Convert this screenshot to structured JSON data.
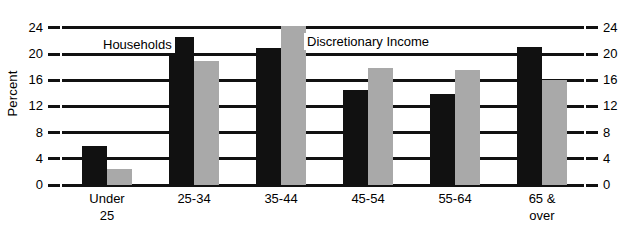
{
  "chart_data": {
    "type": "bar",
    "title": "",
    "xlabel": "",
    "ylabel": "Percent",
    "categories": [
      "Under\n25",
      "25-34",
      "35-44",
      "45-54",
      "55-64",
      "65 &\nover"
    ],
    "series": [
      {
        "name": "Households",
        "color": "#111111",
        "values": [
          5.9,
          22.6,
          20.9,
          14.5,
          13.9,
          21.0
        ]
      },
      {
        "name": "Discretionary Income",
        "color": "#a9a9a9",
        "values": [
          2.4,
          18.9,
          24.3,
          17.8,
          17.6,
          16.1
        ]
      }
    ],
    "ylim": [
      0,
      25.5
    ],
    "yticks": [
      0,
      4,
      8,
      12,
      16,
      20,
      24
    ],
    "ytick_labels": [
      "0",
      "4",
      "8",
      "12",
      "16",
      "20",
      "24"
    ],
    "grid": true,
    "dual_y_axis": true,
    "legend_position": "inline-annotations"
  },
  "axes": {
    "left_title": "Percent",
    "left_tick_labels": [
      "24",
      "20",
      "16",
      "12",
      "8",
      "4",
      "0"
    ],
    "right_tick_labels": [
      "24",
      "20",
      "16",
      "12",
      "8",
      "4",
      "0"
    ]
  },
  "legend": {
    "households_label": "Households",
    "discretionary_label": "Discretionary Income"
  }
}
